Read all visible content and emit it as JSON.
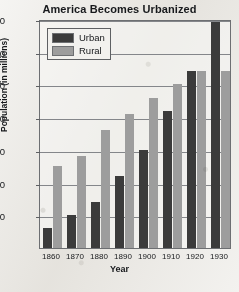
{
  "chart_data": {
    "type": "bar",
    "title": "America Becomes Urbanized",
    "xlabel": "Year",
    "ylabel": "Population (in millions)",
    "categories": [
      "1860",
      "1870",
      "1880",
      "1890",
      "1900",
      "1910",
      "1920",
      "1930"
    ],
    "series": [
      {
        "name": "Urban",
        "color": "#3b3b3b",
        "values": [
          6,
          10,
          14,
          22,
          30,
          42,
          54,
          69
        ]
      },
      {
        "name": "Rural",
        "color": "#9d9d9d",
        "values": [
          25,
          28,
          36,
          41,
          46,
          50,
          54,
          54
        ]
      }
    ],
    "ylim": [
      0,
      70
    ],
    "yticks": [
      10,
      20,
      30,
      40,
      50,
      60,
      70
    ],
    "ytick_labels": [
      "10",
      "20",
      "30",
      "40",
      "50",
      "60",
      "70"
    ],
    "grid": true,
    "legend_position": "top-left"
  }
}
